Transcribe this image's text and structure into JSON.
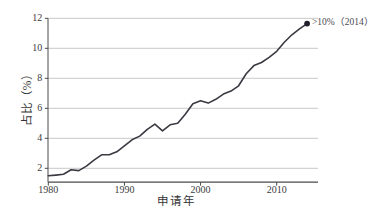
{
  "chart_data": {
    "type": "line",
    "title": "",
    "xlabel": "申请年",
    "ylabel": "占比（%）",
    "x": [
      1980,
      1981,
      1982,
      1983,
      1984,
      1985,
      1986,
      1987,
      1988,
      1989,
      1990,
      1991,
      1992,
      1993,
      1994,
      1995,
      1996,
      1997,
      1998,
      1999,
      2000,
      2001,
      2002,
      2003,
      2004,
      2005,
      2006,
      2007,
      2008,
      2009,
      2010,
      2011,
      2012,
      2013,
      2014
    ],
    "values": [
      1.5,
      1.55,
      1.6,
      1.9,
      1.85,
      2.15,
      2.55,
      2.9,
      2.9,
      3.1,
      3.5,
      3.9,
      4.15,
      4.6,
      4.95,
      4.5,
      4.9,
      5.0,
      5.6,
      6.3,
      6.5,
      6.35,
      6.6,
      6.95,
      7.15,
      7.5,
      8.3,
      8.85,
      9.05,
      9.4,
      9.8,
      10.4,
      10.9,
      11.3,
      11.65
    ],
    "xticks": [
      1980,
      1990,
      2000,
      2010
    ],
    "yticks": [
      2,
      4,
      6,
      8,
      10,
      12
    ],
    "xlim": [
      1980,
      2015.5
    ],
    "ylim": [
      1.07,
      12
    ],
    "grid": "horizontal",
    "legend": "none",
    "colors": {
      "line": "#3a3b42",
      "endpoint_marker": "#20202a",
      "grid": "#c9c9c9",
      "axis": "#4a4a4a",
      "tick_text": "#3c3c3c"
    },
    "endpoint": {
      "x": 2014,
      "y": 11.65,
      "marker": "filled-circle"
    },
    "annotation": {
      "text": ">10%（2014）",
      "anchor_x": 2014,
      "anchor_y": 11.65,
      "position": "right-of-endpoint"
    }
  }
}
